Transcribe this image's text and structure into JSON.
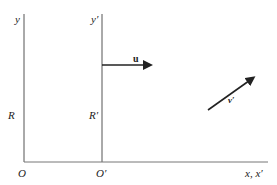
{
  "diagram": {
    "type": "reference-frames",
    "frames": [
      {
        "name": "R",
        "origin_label": "O",
        "y_axis_label": "y",
        "frame_label": "R"
      },
      {
        "name": "R'",
        "origin_label": "O′",
        "y_axis_label": "y′",
        "frame_label": "R′"
      }
    ],
    "shared_x_axis_label": "x, x′",
    "vectors": [
      {
        "label": "u",
        "description": "velocity of frame R′ relative to R, pointing in +x",
        "style": "bold"
      },
      {
        "label": "v′",
        "description": "velocity vector measured in R′, pointing up-right"
      }
    ],
    "colors": {
      "line": "#222222",
      "axis": "#555555",
      "background": "#ffffff"
    }
  },
  "labels": {
    "y": "y",
    "y_prime": "y′",
    "R": "R",
    "R_prime": "R′",
    "O": "O",
    "O_prime": "O′",
    "x_axis": "x, x′",
    "u": "u",
    "v_prime": "v′"
  }
}
